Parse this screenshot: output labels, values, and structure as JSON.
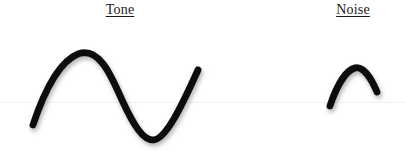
{
  "figure": {
    "width": 406,
    "height": 151,
    "background_color": "#ffffff"
  },
  "panels": [
    {
      "id": "tone",
      "label": "Tone",
      "label_underlined": true,
      "label_color": "#1a1a1a"
    },
    {
      "id": "noise",
      "label": "Noise",
      "label_underlined": true,
      "label_color": "#1a1a1a"
    }
  ],
  "baseline": {
    "y": 102,
    "color": "#f1f1f1",
    "x_start": 0,
    "x_end": 406
  },
  "chart_data": {
    "type": "line",
    "title": "",
    "xlabel": "",
    "ylabel": "",
    "grid": false,
    "legend_position": "top",
    "axis_visible": false,
    "xlim": [
      0,
      406
    ],
    "ylim": [
      151,
      0
    ],
    "stroke_color": "#0d0d0d",
    "stroke_width": 7,
    "shadow_color": "#b4b4b4",
    "series": [
      {
        "name": "Tone",
        "description": "one full sine cycle, large amplitude",
        "amplitude": 49,
        "baseline_y": 102,
        "peak": {
          "x": 78,
          "y": 53
        },
        "trough": {
          "x": 153,
          "y": 140
        },
        "start": {
          "x": 33,
          "y": 125
        },
        "end": {
          "x": 198,
          "y": 70
        },
        "path": "M 33 125 C 41 101 56 63 78 54 C 100 46 112 78 122 100 C 134 126 143 140 153 140 C 165 140 180 110 198 70"
      },
      {
        "name": "Noise",
        "description": "single short arc, small amplitude",
        "amplitude": 34,
        "baseline_y": 102,
        "peak": {
          "x": 354,
          "y": 68
        },
        "start": {
          "x": 330,
          "y": 106
        },
        "end": {
          "x": 377,
          "y": 92
        },
        "path": "M 330 106 C 335 91 344 71 355 68 C 364 66 372 80 377 92"
      }
    ]
  }
}
